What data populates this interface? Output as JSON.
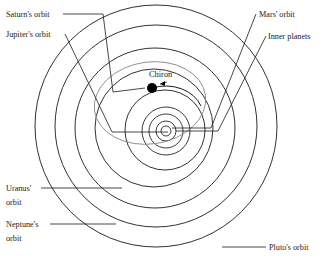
{
  "diagram": {
    "background_color": "#ffffff",
    "line_color": "#1a1a1a",
    "chiron_orbit_color": "#8a8a8a"
  },
  "labels": {
    "saturn": "Saturn's orbit",
    "jupiter": "Jupiter's orbit",
    "mars": "Mars' orbit",
    "inner_planets": "Inner planets",
    "chiron": "Chiron",
    "uranus_line1": "Uranus'",
    "uranus_line2": "orbit",
    "neptune_line1": "Neptune's",
    "neptune_line2": "orbit",
    "pluto": "Pluto's orbit"
  },
  "orbits": [
    {
      "name": "Pluto's orbit",
      "cx": 156,
      "cy": 126,
      "r": 121
    },
    {
      "name": "Neptune's orbit",
      "cx": 156,
      "cy": 126,
      "r": 101
    },
    {
      "name": "Uranus' orbit",
      "cx": 155,
      "cy": 128,
      "r": 80
    },
    {
      "name": "Saturn's orbit",
      "cx": 154,
      "cy": 128,
      "r": 59
    },
    {
      "name": "Jupiter's orbit",
      "cx": 165,
      "cy": 130,
      "r": 40
    },
    {
      "name": "Mars' orbit",
      "cx": 166,
      "cy": 131,
      "r": 24
    },
    {
      "name": "inner planet 2",
      "cx": 166,
      "cy": 131,
      "r": 17
    },
    {
      "name": "inner planet 1",
      "cx": 166,
      "cy": 131,
      "r": 10
    },
    {
      "name": "sun",
      "cx": 166,
      "cy": 131,
      "r": 5
    }
  ],
  "chiron": {
    "dot_x": 152,
    "dot_y": 88,
    "dot_r": 5,
    "label_x": 150,
    "label_y": 76,
    "orbit_cx": 150,
    "orbit_cy": 103,
    "orbit_rx": 56,
    "orbit_ry": 41,
    "orbit_rotation": -8
  },
  "footnote": ""
}
